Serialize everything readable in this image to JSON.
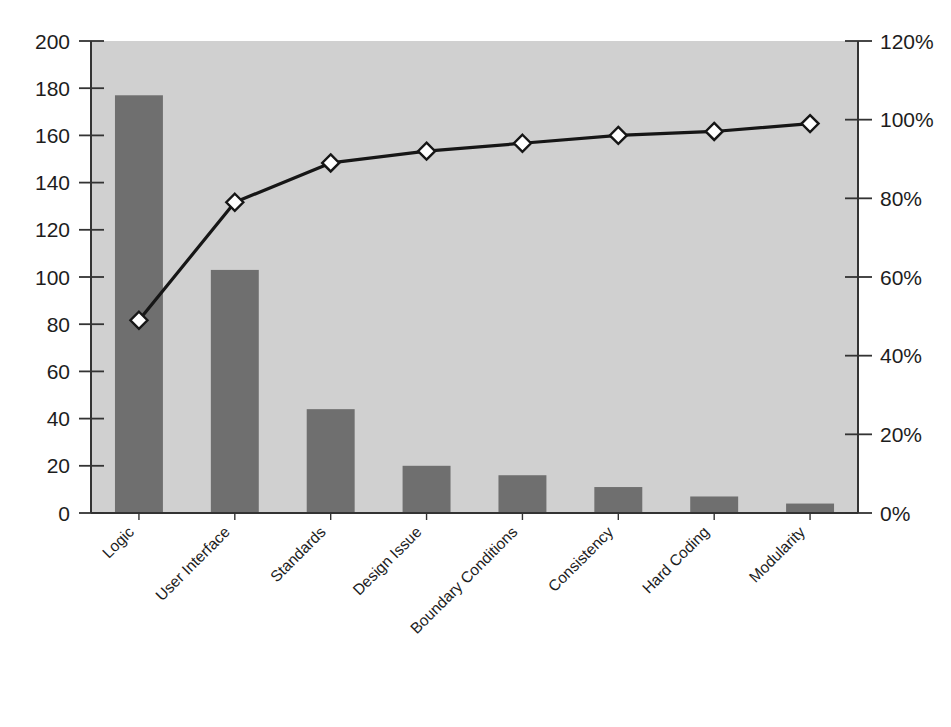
{
  "chart_data": {
    "type": "bar",
    "title": "",
    "subtitle": "",
    "xlabel": "",
    "ylabel": "",
    "y2label": "",
    "categories": [
      "Logic",
      "User Interface",
      "Standards",
      "Design Issue",
      "Boundary Conditions",
      "Consistency",
      "Hard Coding",
      "Modularity"
    ],
    "series": [
      {
        "name": "Count",
        "kind": "bar",
        "axis": "left",
        "values": [
          177,
          103,
          44,
          20,
          16,
          11,
          7,
          4
        ]
      },
      {
        "name": "Cumulative Percent",
        "kind": "line",
        "axis": "right",
        "values": [
          49,
          79,
          89,
          92,
          94,
          96,
          97,
          99
        ]
      }
    ],
    "ylim": [
      0,
      200
    ],
    "ytick_step": 20,
    "ylim_right": [
      0,
      120
    ],
    "ytick_step_right": 20,
    "yticks": [
      "0",
      "20",
      "40",
      "60",
      "80",
      "100",
      "120",
      "140",
      "160",
      "180",
      "200"
    ],
    "yticks_right": [
      "0%",
      "20%",
      "40%",
      "60%",
      "80%",
      "100%",
      "120%"
    ],
    "grid": false,
    "legend": "none",
    "label_rotation_deg": -45,
    "colors": {
      "bar_fill": "#6f6f6f",
      "plot_background": "#d0d0d0",
      "page_background": "#ffffff",
      "line_stroke": "#161616",
      "marker_fill": "#ffffff",
      "marker_stroke": "#161616",
      "axis_stroke": "#333333",
      "text": "#1d1d1d"
    }
  },
  "plot": {
    "left_px": 91,
    "right_px": 858,
    "top_px": 41,
    "bottom_px": 513
  }
}
